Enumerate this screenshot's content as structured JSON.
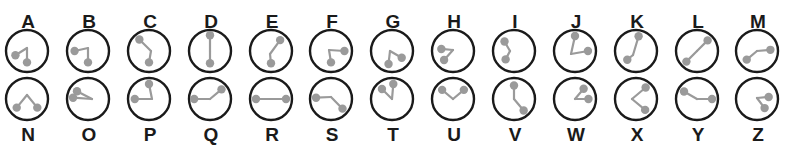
{
  "colors": {
    "background": "#ffffff",
    "ring": "#1a1a1a",
    "hand": "#9a9a9a",
    "label": "#1a1a1a"
  },
  "layout": {
    "radius": 21,
    "knob_radius": 4.2,
    "top_row": {
      "dial_cy": 51,
      "label_y": 28,
      "label_position": "above"
    },
    "bottom_row": {
      "dial_cy": 99,
      "label_y": 141,
      "label_position": "below"
    },
    "column_x": [
      27,
      88,
      149,
      210,
      271,
      331,
      392,
      453,
      514,
      575,
      636,
      697,
      757
    ]
  },
  "angle_convention": "degrees clockwise from 12 o'clock; length as fraction of dial radius",
  "glyphs": {
    "top_row": [
      {
        "letter": "A",
        "hands": [
          {
            "angle": 250,
            "len": 0.78
          },
          {
            "angle": 180,
            "len": 0.72
          }
        ],
        "pivot": [
          0,
          -3
        ]
      },
      {
        "letter": "B",
        "hands": [
          {
            "angle": 270,
            "len": 0.85
          },
          {
            "angle": 180,
            "len": 0.72
          }
        ],
        "pivot": [
          0,
          -3
        ]
      },
      {
        "letter": "C",
        "hands": [
          {
            "angle": 320,
            "len": 0.95
          },
          {
            "angle": 180,
            "len": 0.72
          }
        ],
        "pivot": [
          2,
          0
        ]
      },
      {
        "letter": "D",
        "hands": [
          {
            "angle": 0,
            "len": 1.0
          },
          {
            "angle": 180,
            "len": 0.78
          }
        ],
        "pivot": [
          0,
          0
        ]
      },
      {
        "letter": "E",
        "hands": [
          {
            "angle": 40,
            "len": 0.9
          },
          {
            "angle": 180,
            "len": 0.78
          }
        ],
        "pivot": [
          -1,
          3
        ]
      },
      {
        "letter": "F",
        "hands": [
          {
            "angle": 90,
            "len": 0.85
          },
          {
            "angle": 180,
            "len": 0.72
          }
        ],
        "pivot": [
          -2,
          -1
        ]
      },
      {
        "letter": "G",
        "hands": [
          {
            "angle": 125,
            "len": 0.75
          },
          {
            "angle": 195,
            "len": 0.85
          }
        ],
        "pivot": [
          -2,
          0
        ]
      },
      {
        "letter": "H",
        "hands": [
          {
            "angle": 280,
            "len": 0.75
          },
          {
            "angle": 225,
            "len": 0.8
          }
        ],
        "pivot": [
          0,
          -1
        ]
      },
      {
        "letter": "I",
        "hands": [
          {
            "angle": 315,
            "len": 0.85
          },
          {
            "angle": 225,
            "len": 0.75
          }
        ],
        "pivot": [
          -4,
          0
        ]
      },
      {
        "letter": "J",
        "hands": [
          {
            "angle": 0,
            "len": 0.95
          },
          {
            "angle": 90,
            "len": 0.82
          }
        ],
        "pivot": [
          -4,
          3
        ]
      },
      {
        "letter": "K",
        "hands": [
          {
            "angle": 10,
            "len": 0.95
          },
          {
            "angle": 225,
            "len": 0.78
          }
        ],
        "pivot": [
          -3,
          4
        ]
      },
      {
        "letter": "L",
        "hands": [
          {
            "angle": 45,
            "len": 0.95
          },
          {
            "angle": 225,
            "len": 0.95
          }
        ],
        "pivot": [
          0,
          0
        ]
      },
      {
        "letter": "M",
        "hands": [
          {
            "angle": 85,
            "len": 0.85
          },
          {
            "angle": 230,
            "len": 0.85
          }
        ],
        "pivot": [
          0,
          0
        ]
      }
    ],
    "bottom_row": [
      {
        "letter": "N",
        "hands": [
          {
            "angle": 230,
            "len": 0.85
          },
          {
            "angle": 130,
            "len": 0.85
          }
        ],
        "pivot": [
          0,
          -4
        ]
      },
      {
        "letter": "O",
        "hands": [
          {
            "angle": 305,
            "len": 0.85
          },
          {
            "angle": 275,
            "len": 0.95
          }
        ],
        "pivot": [
          4,
          0
        ]
      },
      {
        "letter": "P",
        "hands": [
          {
            "angle": 270,
            "len": 0.9
          },
          {
            "angle": 0,
            "len": 0.95
          }
        ],
        "pivot": [
          3,
          0
        ]
      },
      {
        "letter": "Q",
        "hands": [
          {
            "angle": 270,
            "len": 1.0
          },
          {
            "angle": 50,
            "len": 0.95
          }
        ],
        "pivot": [
          0,
          0
        ]
      },
      {
        "letter": "R",
        "hands": [
          {
            "angle": 270,
            "len": 0.95
          },
          {
            "angle": 90,
            "len": 0.95
          }
        ],
        "pivot": [
          0,
          0
        ]
      },
      {
        "letter": "S",
        "hands": [
          {
            "angle": 275,
            "len": 0.95
          },
          {
            "angle": 130,
            "len": 0.95
          }
        ],
        "pivot": [
          0,
          -2
        ]
      },
      {
        "letter": "T",
        "hands": [
          {
            "angle": 315,
            "len": 0.9
          },
          {
            "angle": 5,
            "len": 0.95
          }
        ],
        "pivot": [
          0,
          0
        ]
      },
      {
        "letter": "U",
        "hands": [
          {
            "angle": 310,
            "len": 0.9
          },
          {
            "angle": 50,
            "len": 0.9
          }
        ],
        "pivot": [
          0,
          0
        ]
      },
      {
        "letter": "V",
        "hands": [
          {
            "angle": 0,
            "len": 0.85
          },
          {
            "angle": 140,
            "len": 0.95
          }
        ],
        "pivot": [
          0,
          0
        ]
      },
      {
        "letter": "W",
        "hands": [
          {
            "angle": 40,
            "len": 0.85
          },
          {
            "angle": 90,
            "len": 0.85
          }
        ],
        "pivot": [
          0,
          0
        ]
      },
      {
        "letter": "X",
        "hands": [
          {
            "angle": 40,
            "len": 0.95
          },
          {
            "angle": 140,
            "len": 0.9
          }
        ],
        "pivot": [
          -4,
          0
        ]
      },
      {
        "letter": "Y",
        "hands": [
          {
            "angle": 300,
            "len": 0.95
          },
          {
            "angle": 90,
            "len": 0.95
          }
        ],
        "pivot": [
          0,
          0
        ]
      },
      {
        "letter": "Z",
        "hands": [
          {
            "angle": 80,
            "len": 0.75
          },
          {
            "angle": 140,
            "len": 0.75
          }
        ],
        "pivot": [
          0,
          -1
        ]
      }
    ]
  }
}
